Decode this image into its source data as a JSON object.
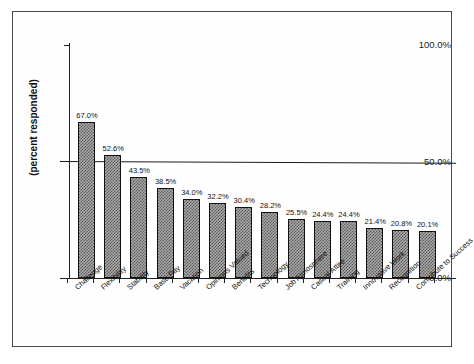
{
  "chart_data": {
    "type": "bar",
    "title": "",
    "xlabel": "",
    "ylabel": "(percent responded)",
    "ylim": [
      0,
      100
    ],
    "grid": false,
    "legend": "none",
    "y_ticks": [
      "0.0%",
      "50.0%",
      "100.0%"
    ],
    "y_tick_values": [
      0,
      50,
      100
    ],
    "reference_line": {
      "value": 50,
      "label": ""
    },
    "categories": [
      "Challenge",
      "Flexibility",
      "Stability",
      "Base Pay",
      "Vacation",
      "Opinions Valued",
      "Benefits",
      "Technology",
      "Job Atmosphere",
      "Casual Attire",
      "Training",
      "Innovative Work",
      "Recognition",
      "Contribute to Success"
    ],
    "values": [
      67.0,
      52.6,
      43.5,
      38.5,
      34.0,
      32.2,
      30.4,
      28.2,
      25.5,
      24.4,
      24.4,
      21.4,
      20.8,
      20.1
    ],
    "data_labels": [
      "67.0%",
      "52.6%",
      "43.5%",
      "38.5%",
      "34.0%",
      "32.2%",
      "30.4%",
      "28.2%",
      "25.5%",
      "24.4%",
      "24.4%",
      "21.4%",
      "20.8%",
      "20.1%"
    ],
    "colors": {
      "bar_fill": "#a9a9a9",
      "bar_pattern": "#5c5c5c",
      "bar_border": "#111111",
      "axis": "#222222",
      "text": "#111111",
      "background": "#ffffff",
      "frame": "#4a4a4a"
    }
  }
}
